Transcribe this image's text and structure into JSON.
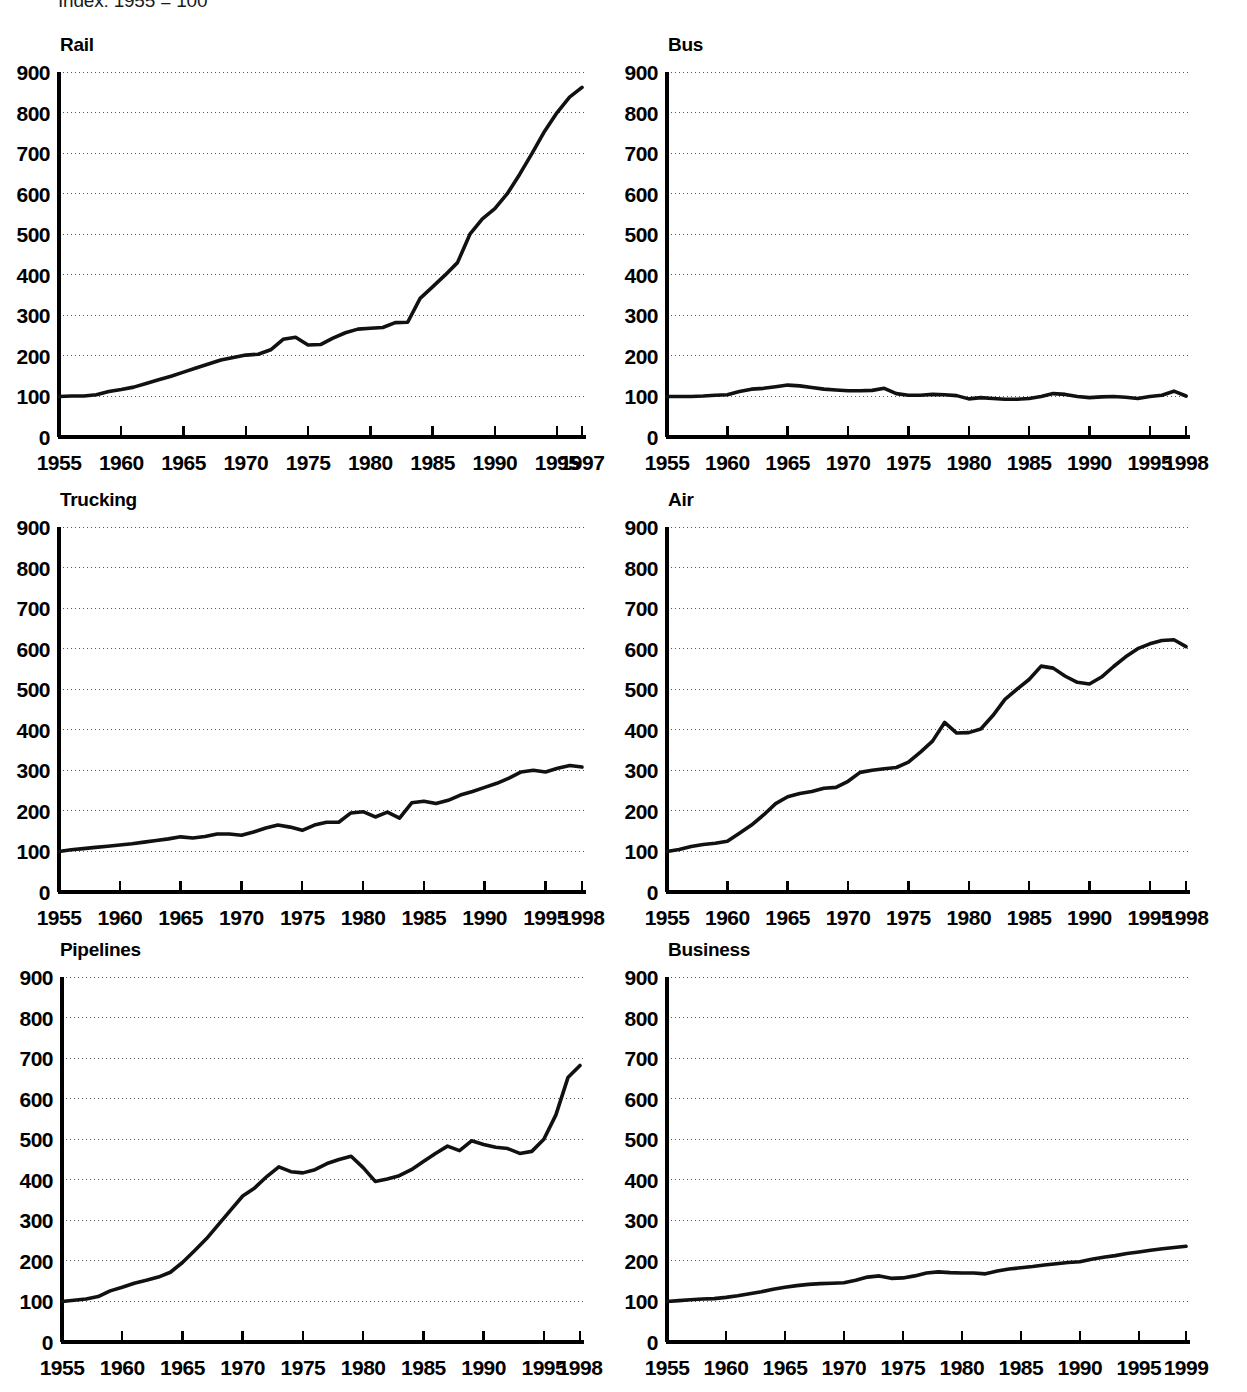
{
  "figure": {
    "index_note": "Index: 1955 = 100",
    "ylabel_values": [
      "900",
      "800",
      "700",
      "600",
      "500",
      "400",
      "300",
      "200",
      "100",
      "0"
    ],
    "accent_color": "#111111",
    "grid_color": "#555555"
  },
  "panels": [
    {
      "key": "rail",
      "title": "Rail",
      "xtick_labels": [
        "1955",
        "1960",
        "1965",
        "1970",
        "1975",
        "1980",
        "1985",
        "1990",
        "1995",
        "1997"
      ],
      "end_year_label": "1997"
    },
    {
      "key": "bus",
      "title": "Bus",
      "xtick_labels": [
        "1955",
        "1960",
        "1965",
        "1970",
        "1975",
        "1980",
        "1985",
        "1990",
        "1995",
        "1998"
      ],
      "end_year_label": "1998"
    },
    {
      "key": "trucking",
      "title": "Trucking",
      "xtick_labels": [
        "1955",
        "1960",
        "1965",
        "1970",
        "1975",
        "1980",
        "1985",
        "1990",
        "1995",
        "1998"
      ],
      "end_year_label": "1998"
    },
    {
      "key": "air",
      "title": "Air",
      "xtick_labels": [
        "1955",
        "1960",
        "1965",
        "1970",
        "1975",
        "1980",
        "1985",
        "1990",
        "1995",
        "1998"
      ],
      "end_year_label": "1998"
    },
    {
      "key": "pipelines",
      "title": "Pipelines",
      "xtick_labels": [
        "1955",
        "1960",
        "1965",
        "1970",
        "1975",
        "1980",
        "1985",
        "1990",
        "1995",
        "1998"
      ],
      "end_year_label": "1998"
    },
    {
      "key": "business",
      "title": "Business",
      "xtick_labels": [
        "1955",
        "1960",
        "1965",
        "1970",
        "1975",
        "1980",
        "1985",
        "1990",
        "1995",
        "1999"
      ],
      "end_year_label": "1999"
    }
  ],
  "chart_data": [
    {
      "type": "line",
      "title": "Rail",
      "xlabel": "",
      "ylabel": "Index: 1955 = 100",
      "xlim": [
        1955,
        1997
      ],
      "ylim": [
        0,
        900
      ],
      "grid": true,
      "legend": "none",
      "xticks": [
        1955,
        1960,
        1965,
        1970,
        1975,
        1980,
        1985,
        1990,
        1995,
        1997
      ],
      "yticks": [
        0,
        100,
        200,
        300,
        400,
        500,
        600,
        700,
        800,
        900
      ],
      "series": [
        {
          "name": "Rail",
          "x": [
            1955,
            1956,
            1957,
            1958,
            1959,
            1960,
            1961,
            1962,
            1963,
            1964,
            1965,
            1966,
            1967,
            1968,
            1969,
            1970,
            1971,
            1972,
            1973,
            1974,
            1975,
            1976,
            1977,
            1978,
            1979,
            1980,
            1981,
            1982,
            1983,
            1984,
            1985,
            1986,
            1987,
            1988,
            1989,
            1990,
            1991,
            1992,
            1993,
            1994,
            1995,
            1996,
            1997
          ],
          "values": [
            100,
            101,
            101,
            104,
            112,
            117,
            123,
            132,
            141,
            150,
            160,
            170,
            180,
            190,
            196,
            202,
            204,
            215,
            241,
            246,
            227,
            228,
            244,
            257,
            266,
            268,
            270,
            282,
            283,
            342,
            370,
            399,
            430,
            500,
            538,
            563,
            600,
            648,
            700,
            754,
            800,
            838,
            862
          ]
        }
      ]
    },
    {
      "type": "line",
      "title": "Bus",
      "xlabel": "",
      "ylabel": "Index: 1955 = 100",
      "xlim": [
        1955,
        1998
      ],
      "ylim": [
        0,
        900
      ],
      "grid": true,
      "legend": "none",
      "xticks": [
        1955,
        1960,
        1965,
        1970,
        1975,
        1980,
        1985,
        1990,
        1995,
        1998
      ],
      "yticks": [
        0,
        100,
        200,
        300,
        400,
        500,
        600,
        700,
        800,
        900
      ],
      "series": [
        {
          "name": "Bus",
          "x": [
            1955,
            1956,
            1957,
            1958,
            1959,
            1960,
            1961,
            1962,
            1963,
            1964,
            1965,
            1966,
            1967,
            1968,
            1969,
            1970,
            1971,
            1972,
            1973,
            1974,
            1975,
            1976,
            1977,
            1978,
            1979,
            1980,
            1981,
            1982,
            1983,
            1984,
            1985,
            1986,
            1987,
            1988,
            1989,
            1990,
            1991,
            1992,
            1993,
            1994,
            1995,
            1996,
            1997,
            1998
          ],
          "values": [
            100,
            100,
            100,
            101,
            103,
            104,
            112,
            118,
            120,
            124,
            128,
            126,
            122,
            118,
            116,
            114,
            114,
            115,
            120,
            107,
            103,
            103,
            105,
            104,
            102,
            94,
            97,
            95,
            93,
            93,
            95,
            100,
            107,
            105,
            100,
            97,
            99,
            100,
            98,
            95,
            100,
            103,
            113,
            101
          ]
        }
      ]
    },
    {
      "type": "line",
      "title": "Trucking",
      "xlabel": "",
      "ylabel": "Index: 1955 = 100",
      "xlim": [
        1955,
        1998
      ],
      "ylim": [
        0,
        900
      ],
      "grid": true,
      "legend": "none",
      "xticks": [
        1955,
        1960,
        1965,
        1970,
        1975,
        1980,
        1985,
        1990,
        1995,
        1998
      ],
      "yticks": [
        0,
        100,
        200,
        300,
        400,
        500,
        600,
        700,
        800,
        900
      ],
      "series": [
        {
          "name": "Trucking",
          "x": [
            1955,
            1956,
            1957,
            1958,
            1959,
            1960,
            1961,
            1962,
            1963,
            1964,
            1965,
            1966,
            1967,
            1968,
            1969,
            1970,
            1971,
            1972,
            1973,
            1974,
            1975,
            1976,
            1977,
            1978,
            1979,
            1980,
            1981,
            1982,
            1983,
            1984,
            1985,
            1986,
            1987,
            1988,
            1989,
            1990,
            1991,
            1992,
            1993,
            1994,
            1995,
            1996,
            1997,
            1998
          ],
          "values": [
            100,
            104,
            107,
            110,
            113,
            116,
            119,
            123,
            127,
            131,
            136,
            133,
            137,
            143,
            143,
            140,
            148,
            158,
            165,
            160,
            152,
            165,
            172,
            172,
            195,
            198,
            185,
            197,
            182,
            220,
            224,
            218,
            226,
            239,
            248,
            258,
            268,
            281,
            296,
            300,
            296,
            305,
            312,
            308
          ]
        }
      ]
    },
    {
      "type": "line",
      "title": "Air",
      "xlabel": "",
      "ylabel": "Index: 1955 = 100",
      "xlim": [
        1955,
        1998
      ],
      "ylim": [
        0,
        900
      ],
      "grid": true,
      "legend": "none",
      "xticks": [
        1955,
        1960,
        1965,
        1970,
        1975,
        1980,
        1985,
        1990,
        1995,
        1998
      ],
      "yticks": [
        0,
        100,
        200,
        300,
        400,
        500,
        600,
        700,
        800,
        900
      ],
      "series": [
        {
          "name": "Air",
          "x": [
            1955,
            1956,
            1957,
            1958,
            1959,
            1960,
            1961,
            1962,
            1963,
            1964,
            1965,
            1966,
            1967,
            1968,
            1969,
            1970,
            1971,
            1972,
            1973,
            1974,
            1975,
            1976,
            1977,
            1978,
            1979,
            1980,
            1981,
            1982,
            1983,
            1984,
            1985,
            1986,
            1987,
            1988,
            1989,
            1990,
            1991,
            1992,
            1993,
            1994,
            1995,
            1996,
            1997,
            1998
          ],
          "values": [
            100,
            105,
            112,
            117,
            120,
            125,
            145,
            165,
            190,
            218,
            235,
            243,
            248,
            256,
            258,
            273,
            295,
            300,
            304,
            307,
            320,
            345,
            372,
            418,
            392,
            393,
            402,
            435,
            475,
            500,
            524,
            557,
            552,
            532,
            517,
            513,
            530,
            556,
            580,
            600,
            612,
            620,
            622,
            605
          ]
        }
      ]
    },
    {
      "type": "line",
      "title": "Pipelines",
      "xlabel": "",
      "ylabel": "Index: 1955 = 100",
      "xlim": [
        1955,
        1998
      ],
      "ylim": [
        0,
        900
      ],
      "grid": true,
      "legend": "none",
      "xticks": [
        1955,
        1960,
        1965,
        1970,
        1975,
        1980,
        1985,
        1990,
        1995,
        1998
      ],
      "yticks": [
        0,
        100,
        200,
        300,
        400,
        500,
        600,
        700,
        800,
        900
      ],
      "series": [
        {
          "name": "Pipelines",
          "x": [
            1955,
            1956,
            1957,
            1958,
            1959,
            1960,
            1961,
            1962,
            1963,
            1964,
            1965,
            1966,
            1967,
            1968,
            1969,
            1970,
            1971,
            1972,
            1973,
            1974,
            1975,
            1976,
            1977,
            1978,
            1979,
            1980,
            1981,
            1982,
            1983,
            1984,
            1985,
            1986,
            1987,
            1988,
            1989,
            1990,
            1991,
            1992,
            1993,
            1994,
            1995,
            1996,
            1997,
            1998
          ],
          "values": [
            100,
            103,
            106,
            112,
            126,
            135,
            145,
            152,
            160,
            172,
            196,
            225,
            255,
            290,
            325,
            360,
            380,
            408,
            432,
            420,
            417,
            425,
            440,
            450,
            458,
            430,
            396,
            402,
            410,
            425,
            445,
            465,
            483,
            472,
            496,
            487,
            480,
            477,
            465,
            470,
            500,
            560,
            652,
            682
          ]
        }
      ]
    },
    {
      "type": "line",
      "title": "Business",
      "xlabel": "",
      "ylabel": "Index: 1955 = 100",
      "xlim": [
        1955,
        1999
      ],
      "ylim": [
        0,
        900
      ],
      "grid": true,
      "legend": "none",
      "xticks": [
        1955,
        1960,
        1965,
        1970,
        1975,
        1980,
        1985,
        1990,
        1995,
        1999
      ],
      "yticks": [
        0,
        100,
        200,
        300,
        400,
        500,
        600,
        700,
        800,
        900
      ],
      "series": [
        {
          "name": "Business",
          "x": [
            1955,
            1956,
            1957,
            1958,
            1959,
            1960,
            1961,
            1962,
            1963,
            1964,
            1965,
            1966,
            1967,
            1968,
            1969,
            1970,
            1971,
            1972,
            1973,
            1974,
            1975,
            1976,
            1977,
            1978,
            1979,
            1980,
            1981,
            1982,
            1983,
            1984,
            1985,
            1986,
            1987,
            1988,
            1989,
            1990,
            1991,
            1992,
            1993,
            1994,
            1995,
            1996,
            1997,
            1998,
            1999
          ],
          "values": [
            100,
            102,
            104,
            106,
            107,
            110,
            114,
            119,
            124,
            130,
            135,
            139,
            142,
            144,
            145,
            146,
            152,
            160,
            163,
            157,
            158,
            163,
            170,
            173,
            171,
            170,
            170,
            168,
            175,
            180,
            183,
            186,
            190,
            193,
            196,
            198,
            204,
            209,
            213,
            218,
            222,
            226,
            230,
            233,
            236
          ]
        }
      ]
    }
  ]
}
